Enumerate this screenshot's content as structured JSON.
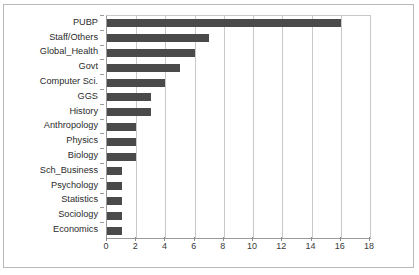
{
  "chart_data": {
    "type": "bar",
    "orientation": "horizontal",
    "title": "",
    "xlabel": "",
    "ylabel": "",
    "xlim": [
      0,
      18
    ],
    "xticks": [
      0,
      2,
      4,
      6,
      8,
      10,
      12,
      14,
      16,
      18
    ],
    "grid": true,
    "legend": false,
    "bar_color": "#4a4a4a",
    "categories": [
      "PUBP",
      "Staff/Others",
      "Global_Health",
      "Govt",
      "Computer Sci.",
      "GGS",
      "History",
      "Anthropology",
      "Physics",
      "Biology",
      "Sch_Business",
      "Psychology",
      "Statistics",
      "Sociology",
      "Economics"
    ],
    "values": [
      16,
      7,
      6,
      5,
      4,
      3,
      3,
      2,
      2,
      2,
      1,
      1,
      1,
      1,
      1
    ]
  }
}
